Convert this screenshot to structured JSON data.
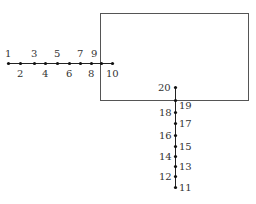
{
  "diagram": {
    "rectangle": {
      "x": 100,
      "y": 13,
      "width": 148,
      "height": 87,
      "stroke": "#555555"
    },
    "line_color": "#222222",
    "dot_color": "#111111",
    "horizontal_line": {
      "y": 63,
      "x1": 8,
      "x2": 112
    },
    "vertical_line": {
      "x": 175,
      "y1": 87,
      "y2": 187
    },
    "points": [
      {
        "id": "1",
        "label": "1",
        "x": 8,
        "y": 63,
        "lx": 5,
        "ly": 57
      },
      {
        "id": "2",
        "label": "2",
        "x": 20,
        "y": 63,
        "lx": 17,
        "ly": 77
      },
      {
        "id": "3",
        "label": "3",
        "x": 34,
        "y": 63,
        "lx": 31,
        "ly": 57
      },
      {
        "id": "4",
        "label": "4",
        "x": 45,
        "y": 63,
        "lx": 42,
        "ly": 77
      },
      {
        "id": "5",
        "label": "5",
        "x": 57,
        "y": 63,
        "lx": 54,
        "ly": 57
      },
      {
        "id": "6",
        "label": "6",
        "x": 69,
        "y": 63,
        "lx": 66,
        "ly": 77
      },
      {
        "id": "7",
        "label": "7",
        "x": 80,
        "y": 63,
        "lx": 77,
        "ly": 57
      },
      {
        "id": "8",
        "label": "8",
        "x": 91,
        "y": 63,
        "lx": 88,
        "ly": 77
      },
      {
        "id": "9",
        "label": "9",
        "x": 101,
        "y": 63,
        "lx": 91,
        "ly": 57
      },
      {
        "id": "10",
        "label": "10",
        "x": 112,
        "y": 63,
        "lx": 106,
        "ly": 77
      },
      {
        "id": "20",
        "label": "20",
        "x": 175,
        "y": 87,
        "lx": 158,
        "ly": 91
      },
      {
        "id": "19",
        "label": "19",
        "x": 175,
        "y": 100,
        "lx": 179,
        "ly": 109
      },
      {
        "id": "18",
        "label": "18",
        "x": 175,
        "y": 112,
        "lx": 159,
        "ly": 116
      },
      {
        "id": "17",
        "label": "17",
        "x": 175,
        "y": 123,
        "lx": 179,
        "ly": 127
      },
      {
        "id": "16",
        "label": "16",
        "x": 175,
        "y": 135,
        "lx": 159,
        "ly": 139
      },
      {
        "id": "15",
        "label": "15",
        "x": 175,
        "y": 146,
        "lx": 179,
        "ly": 150
      },
      {
        "id": "14",
        "label": "14",
        "x": 175,
        "y": 156,
        "lx": 159,
        "ly": 160
      },
      {
        "id": "13",
        "label": "13",
        "x": 175,
        "y": 166,
        "lx": 179,
        "ly": 170
      },
      {
        "id": "12",
        "label": "12",
        "x": 175,
        "y": 176,
        "lx": 159,
        "ly": 180
      },
      {
        "id": "11",
        "label": "11",
        "x": 175,
        "y": 187,
        "lx": 179,
        "ly": 191
      }
    ]
  }
}
